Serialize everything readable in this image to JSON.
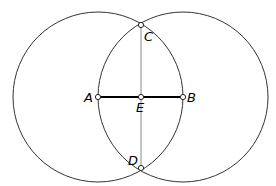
{
  "diagram": {
    "type": "geometric-construction",
    "points": [
      {
        "id": "A",
        "label": "A",
        "x": 98,
        "y": 97,
        "lx": 84,
        "ly": 102
      },
      {
        "id": "B",
        "label": "B",
        "x": 183,
        "y": 97,
        "lx": 187,
        "ly": 102
      },
      {
        "id": "C",
        "label": "C",
        "x": 141,
        "y": 25,
        "lx": 144,
        "ly": 41
      },
      {
        "id": "D",
        "label": "D",
        "x": 141,
        "y": 168,
        "lx": 128,
        "ly": 165
      },
      {
        "id": "E",
        "label": "E",
        "x": 141,
        "y": 97,
        "lx": 136,
        "ly": 112
      }
    ],
    "circles": [
      {
        "id": "circle-A",
        "center": "A",
        "cx": 98,
        "cy": 97,
        "r": 85
      },
      {
        "id": "circle-B",
        "center": "B",
        "cx": 183,
        "cy": 97,
        "r": 85
      }
    ],
    "segments": [
      {
        "id": "AB",
        "from": "A",
        "to": "B",
        "weight": "bold"
      },
      {
        "id": "CD",
        "from": "C",
        "to": "D",
        "weight": "thin"
      }
    ],
    "colors": {
      "stroke": "#333333",
      "segment_thin": "#888888",
      "segment_bold": "#000000",
      "point_fill": "#ffffff"
    }
  }
}
